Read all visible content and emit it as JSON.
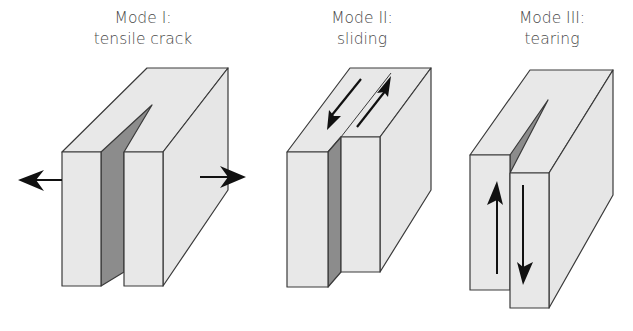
{
  "figure": {
    "modes": [
      {
        "id": "mode-1",
        "title": "Mode I:",
        "subtitle": "tensile crack",
        "center_x": 143
      },
      {
        "id": "mode-2",
        "title": "Mode II:",
        "subtitle": "sliding",
        "center_x": 362
      },
      {
        "id": "mode-3",
        "title": "Mode III:",
        "subtitle": "tearing",
        "center_x": 552
      }
    ],
    "colors": {
      "face": "#e8e8e8",
      "crack": "#8c8c8c",
      "outline": "#3a3a3a",
      "arrow": "#111111",
      "text": "#4a4a4a"
    }
  }
}
